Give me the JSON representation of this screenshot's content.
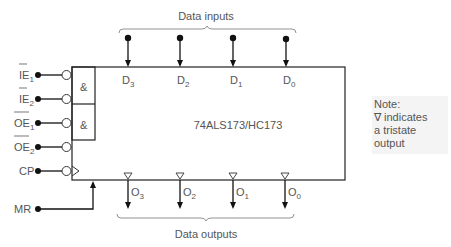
{
  "chip": {
    "label": "74ALS173/HC173"
  },
  "gates": {
    "and1": "&",
    "and2": "&"
  },
  "inputs_left": [
    {
      "name": "IE",
      "sub": "1",
      "bar": true
    },
    {
      "name": "IE",
      "sub": "2",
      "bar": true
    },
    {
      "name": "OE",
      "sub": "1",
      "bar": true
    },
    {
      "name": "OE",
      "sub": "2",
      "bar": true
    },
    {
      "name": "CP",
      "sub": "",
      "bar": false
    },
    {
      "name": "MR",
      "sub": "",
      "bar": false
    }
  ],
  "data_inputs": {
    "label": "Data inputs",
    "pins": [
      {
        "name": "D",
        "sub": "3"
      },
      {
        "name": "D",
        "sub": "2"
      },
      {
        "name": "D",
        "sub": "1"
      },
      {
        "name": "D",
        "sub": "0"
      }
    ]
  },
  "data_outputs": {
    "label": "Data outputs",
    "pins": [
      {
        "name": "O",
        "sub": "3"
      },
      {
        "name": "O",
        "sub": "2"
      },
      {
        "name": "O",
        "sub": "1"
      },
      {
        "name": "O",
        "sub": "0"
      }
    ]
  },
  "note": {
    "line1": "Note:",
    "line2": "∇ indicates",
    "line3": "a tristate",
    "line4": "output"
  }
}
